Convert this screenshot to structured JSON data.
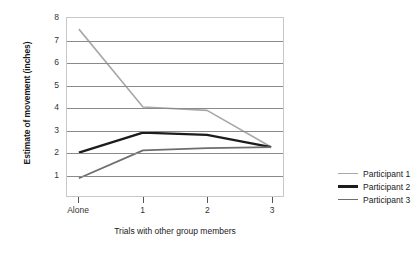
{
  "chart_data": {
    "type": "line",
    "title": "",
    "xlabel": "Trials with other group members",
    "ylabel": "Estimate of movement (inches)",
    "categories": [
      "Alone",
      "1",
      "2",
      "3"
    ],
    "yticks": [
      1,
      2,
      3,
      4,
      5,
      6,
      7,
      8
    ],
    "ylim": [
      0,
      8
    ],
    "grid": true,
    "legend_position": "right",
    "series": [
      {
        "name": "Participant 1",
        "values": [
          7.5,
          4.0,
          3.85,
          2.2
        ],
        "color": "#a8a8a8",
        "width": 1.6
      },
      {
        "name": "Participant 2",
        "values": [
          1.95,
          2.85,
          2.75,
          2.2
        ],
        "color": "#1c1c1c",
        "width": 2.4
      },
      {
        "name": "Participant 3",
        "values": [
          0.8,
          2.05,
          2.15,
          2.2
        ],
        "color": "#6e6e6e",
        "width": 1.8
      }
    ]
  }
}
